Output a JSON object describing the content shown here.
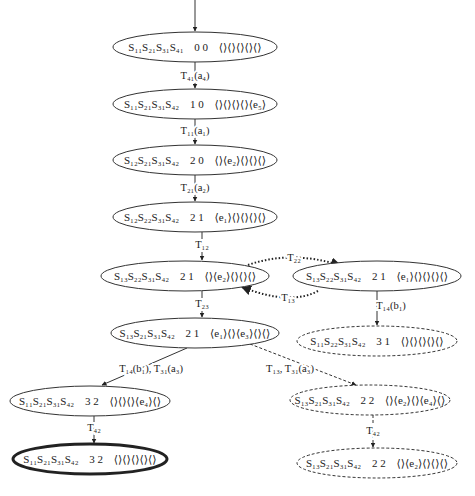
{
  "diagram": {
    "title": "",
    "type": "state-reachability-graph",
    "nodes": [
      {
        "id": "n1",
        "state": "S₁₁S₂₁S₃₁S₄₁",
        "marking": "0 0",
        "queues": "⟨⟩⟨⟩⟨⟩⟨⟩⟨⟩",
        "style": "solid",
        "cx": 195,
        "cy": 47,
        "rx": 82,
        "ry": 15
      },
      {
        "id": "n2",
        "state": "S₁₁S₂₁S₃₁S₄₂",
        "marking": "1 0",
        "queues": "⟨⟩⟨⟩⟨⟩⟨⟩⟨e₅⟩",
        "style": "solid",
        "cx": 195,
        "cy": 104,
        "rx": 82,
        "ry": 15
      },
      {
        "id": "n3",
        "state": "S₁₂S₂₁S₃₁S₄₂",
        "marking": "2 0",
        "queues": "⟨⟩⟨e₂⟩⟨⟩⟨⟩⟨⟩",
        "style": "solid",
        "cx": 195,
        "cy": 160,
        "rx": 82,
        "ry": 15
      },
      {
        "id": "n4",
        "state": "S₁₂S₂₂S₃₁S₄₂",
        "marking": "2 1",
        "queues": "⟨e₁⟩⟨⟩⟨⟩⟨⟩⟨⟩",
        "style": "solid",
        "cx": 195,
        "cy": 217,
        "rx": 82,
        "ry": 15
      },
      {
        "id": "n5",
        "state": "S₁₃S₂₂S₃₁S₄₂",
        "marking": "2 1",
        "queues": "⟨⟩⟨e₂⟩⟨⟩⟨⟩⟨⟩",
        "style": "solid",
        "cx": 185,
        "cy": 276,
        "rx": 84,
        "ry": 15
      },
      {
        "id": "n6",
        "state": "S₁₃S₂₂S₃₁S₄₂",
        "marking": "2 1",
        "queues": "⟨e₁⟩⟨⟩⟨⟩⟨⟩⟨⟩",
        "style": "solid",
        "cx": 377,
        "cy": 276,
        "rx": 84,
        "ry": 15
      },
      {
        "id": "n7",
        "state": "S₁₃S₂₁S₃₁S₄₂",
        "marking": "2 1",
        "queues": "⟨e₁⟩⟨⟩⟨e₃⟩⟨⟩⟨⟩",
        "style": "solid",
        "cx": 195,
        "cy": 333,
        "rx": 84,
        "ry": 15
      },
      {
        "id": "n8",
        "state": "S₁₁S₂₂S₃₁S₄₂",
        "marking": "3 1",
        "queues": "⟨⟩⟨⟩⟨⟩⟨⟩⟨⟩",
        "style": "dashed",
        "cx": 377,
        "cy": 341,
        "rx": 80,
        "ry": 15
      },
      {
        "id": "n9",
        "state": "S₁₁S₂₁S₃₁S₄₂",
        "marking": "3 2",
        "queues": "⟨⟩⟨⟩⟨⟩⟨e₄⟩⟨⟩",
        "style": "solid",
        "cx": 90,
        "cy": 401,
        "rx": 80,
        "ry": 15
      },
      {
        "id": "n10",
        "state": "S₁₁S₂₁S₃₁S₄₂",
        "marking": "3 2",
        "queues": "⟨⟩⟨⟩⟨⟩⟨⟩⟨⟩",
        "style": "double",
        "cx": 90,
        "cy": 459,
        "rx": 77,
        "ry": 15
      },
      {
        "id": "n11",
        "state": "S₁₃S₂₁S₃₁S₄₂",
        "marking": "2 2",
        "queues": "⟨⟩⟨e₂⟩⟨⟩⟨e₄⟩⟨⟩",
        "style": "dashed",
        "cx": 370,
        "cy": 400,
        "rx": 80,
        "ry": 15
      },
      {
        "id": "n12",
        "state": "S₁₃S₂₁S₃₁S₄₂",
        "marking": "2 2",
        "queues": "⟨⟩⟨e₂⟩⟨⟩⟨⟩⟨⟩",
        "style": "dashed",
        "cx": 377,
        "cy": 463,
        "rx": 80,
        "ry": 15
      }
    ],
    "edges": [
      {
        "id": "e0",
        "from": "start",
        "to": "n1",
        "label": "",
        "style": "solid"
      },
      {
        "id": "e1",
        "from": "n1",
        "to": "n2",
        "label": "T₄₁(a₄)",
        "style": "solid"
      },
      {
        "id": "e2",
        "from": "n2",
        "to": "n3",
        "label": "T₁₁(a₁)",
        "style": "solid"
      },
      {
        "id": "e3",
        "from": "n3",
        "to": "n4",
        "label": "T₂₁(a₂)",
        "style": "solid"
      },
      {
        "id": "e4",
        "from": "n4",
        "to": "n5",
        "label": "T₁₂",
        "style": "solid"
      },
      {
        "id": "e5",
        "from": "n5",
        "to": "n6",
        "label": "T₂₂",
        "style": "dotted"
      },
      {
        "id": "e6",
        "from": "n6",
        "to": "n5",
        "label": "T₁₃",
        "style": "dotted"
      },
      {
        "id": "e7",
        "from": "n5",
        "to": "n7",
        "label": "T₂₃",
        "style": "solid"
      },
      {
        "id": "e8",
        "from": "n6",
        "to": "n8",
        "label": "T₁₄(b₁)",
        "style": "solid"
      },
      {
        "id": "e9",
        "from": "n7",
        "to": "n9",
        "label": "T₁₄(b₁), T₃₁(a₃)",
        "style": "solid"
      },
      {
        "id": "e10",
        "from": "n7",
        "to": "n11",
        "label": "T₁₃, T₃₁(a₃)",
        "style": "dashed"
      },
      {
        "id": "e11",
        "from": "n9",
        "to": "n10",
        "label": "T₄₂",
        "style": "solid"
      },
      {
        "id": "e12",
        "from": "n11",
        "to": "n12",
        "label": "T₄₂",
        "style": "dashed"
      }
    ]
  },
  "colors": {
    "stroke": "#333333",
    "text": "#222222",
    "background": "#ffffff"
  }
}
